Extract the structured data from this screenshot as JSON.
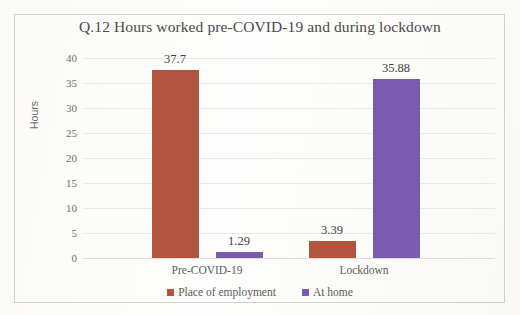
{
  "chart_data": {
    "type": "bar",
    "title": "Q.12 Hours worked pre-COVID-19 and during lockdown",
    "xlabel": "",
    "ylabel": "Hours",
    "categories": [
      "Pre-COVID-19",
      "Lockdown"
    ],
    "series": [
      {
        "name": "Place of employment",
        "color": "#b3543e",
        "values": [
          37.7,
          3.39
        ],
        "labels": [
          "37.7",
          "3.39"
        ]
      },
      {
        "name": "At home",
        "color": "#7a5cae",
        "values": [
          1.29,
          35.88
        ],
        "labels": [
          "1.29",
          "35.88"
        ]
      }
    ],
    "ylim": [
      0,
      40
    ],
    "yticks": [
      40,
      35,
      30,
      25,
      20,
      15,
      10,
      5,
      0
    ],
    "ytick_labels": [
      "40",
      "35",
      "30",
      "25",
      "20",
      "15",
      "10",
      "5",
      "0"
    ],
    "grid": true,
    "legend_position": "bottom"
  },
  "frame": {
    "border_color": "#cfcfcf"
  }
}
